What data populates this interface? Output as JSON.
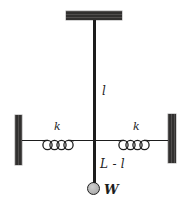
{
  "diagram": {
    "labels": {
      "upper_string_length": "l",
      "left_spring_constant": "k",
      "right_spring_constant": "k",
      "lower_string_length": "L - l",
      "weight": "W"
    },
    "colors": {
      "ink": "#1d1d1d",
      "support": "#3c3a39",
      "ball": "#b0b0b0",
      "bg": "#ffffff"
    }
  }
}
